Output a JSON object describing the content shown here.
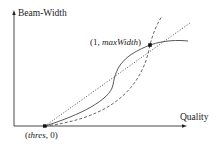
{
  "diagram": {
    "y_axis_label": "Beam-Width",
    "x_axis_label": "Quality",
    "points": {
      "start": {
        "label": "(thres, 0)",
        "label_parts": [
          "(",
          "thres",
          ", 0)"
        ]
      },
      "end": {
        "label": "(1, maxWidth)",
        "label_parts": [
          "(1, ",
          "maxWidth",
          ")"
        ]
      }
    },
    "curves": [
      {
        "name": "linear",
        "style": "dotted"
      },
      {
        "name": "sigmoid",
        "style": "solid"
      },
      {
        "name": "convex",
        "style": "dashed"
      }
    ],
    "colors": {
      "line": "#444444",
      "background": "#ffffff"
    }
  }
}
